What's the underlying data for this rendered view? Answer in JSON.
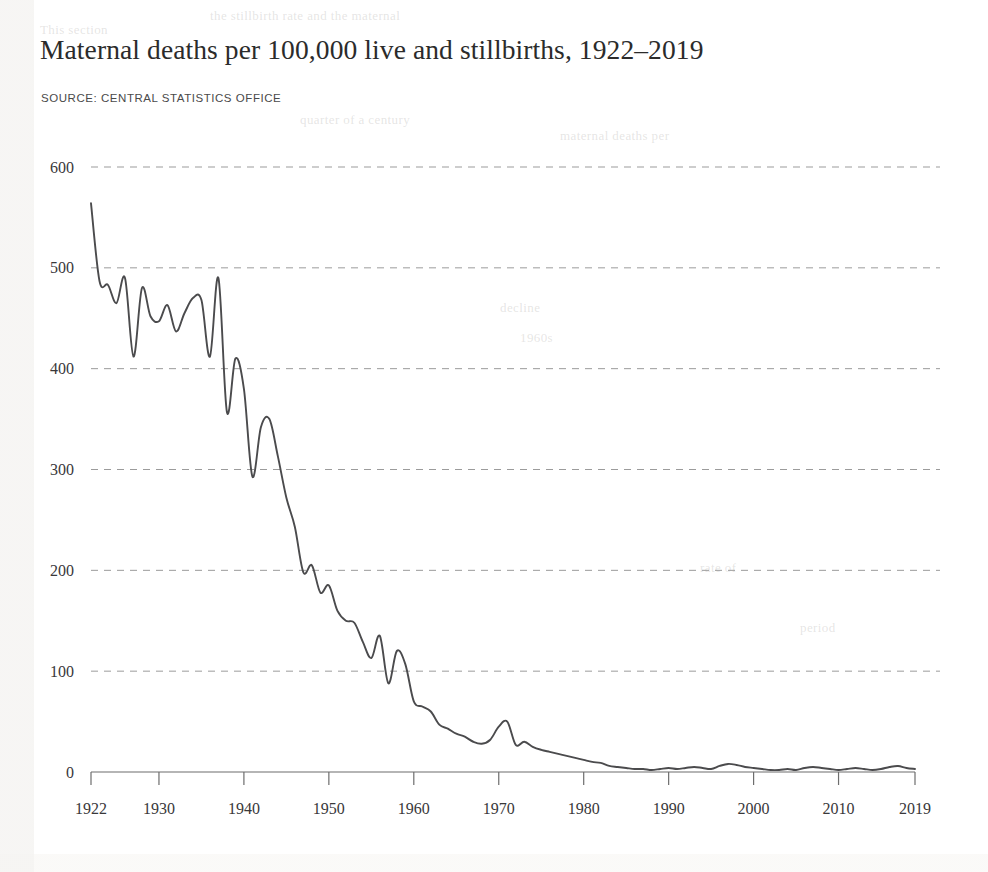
{
  "header": {
    "title": "Maternal deaths per 100,000 live and stillbirths, 1922–2019",
    "source": "SOURCE: CENTRAL STATISTICS OFFICE"
  },
  "ghost": [
    {
      "text": "the stillbirth rate and the maternal",
      "x": 210,
      "y": 8
    },
    {
      "text": "This section",
      "x": 40,
      "y": 22
    },
    {
      "text": "quarter of a century",
      "x": 300,
      "y": 112
    },
    {
      "text": "maternal deaths per",
      "x": 560,
      "y": 128
    },
    {
      "text": "decline",
      "x": 500,
      "y": 300
    },
    {
      "text": "1960s",
      "x": 520,
      "y": 330
    },
    {
      "text": "rate of",
      "x": 700,
      "y": 560
    },
    {
      "text": "period",
      "x": 800,
      "y": 620
    }
  ],
  "style": {
    "line_color": "#4b4b4d",
    "gridline_color": "#9b9b9b",
    "axis_color": "#6d6d6d",
    "text_color": "#39383a"
  },
  "chart_data": {
    "type": "line",
    "title": "Maternal deaths per 100,000 live and stillbirths, 1922–2019",
    "subtitle": "SOURCE: CENTRAL STATISTICS OFFICE",
    "xlabel": "",
    "ylabel": "",
    "xlim": [
      1922,
      2019
    ],
    "ylim": [
      0,
      600
    ],
    "grid": true,
    "grid_axis": "y",
    "legend": false,
    "y_ticks": [
      0,
      100,
      200,
      300,
      400,
      500,
      600
    ],
    "y_tick_labels": [
      "0",
      "100",
      "200",
      "300",
      "400",
      "500",
      "600"
    ],
    "x_ticks": [
      1922,
      1930,
      1940,
      1950,
      1960,
      1970,
      1980,
      1990,
      2000,
      2010,
      2019
    ],
    "x_tick_labels": [
      "1922",
      "1930",
      "1940",
      "1950",
      "1960",
      "1970",
      "1980",
      "1990",
      "2000",
      "2010",
      "2019"
    ],
    "series": [
      {
        "name": "Maternal deaths per 100,000 live and stillbirths",
        "x": [
          1922,
          1923,
          1924,
          1925,
          1926,
          1927,
          1928,
          1929,
          1930,
          1931,
          1932,
          1933,
          1934,
          1935,
          1936,
          1937,
          1938,
          1939,
          1940,
          1941,
          1942,
          1943,
          1944,
          1945,
          1946,
          1947,
          1948,
          1949,
          1950,
          1951,
          1952,
          1953,
          1954,
          1955,
          1956,
          1957,
          1958,
          1959,
          1960,
          1961,
          1962,
          1963,
          1964,
          1965,
          1966,
          1967,
          1968,
          1969,
          1970,
          1971,
          1972,
          1973,
          1974,
          1975,
          1976,
          1977,
          1978,
          1979,
          1980,
          1981,
          1982,
          1983,
          1984,
          1985,
          1986,
          1987,
          1988,
          1989,
          1990,
          1991,
          1992,
          1993,
          1994,
          1995,
          1996,
          1997,
          1998,
          1999,
          2000,
          2001,
          2002,
          2003,
          2004,
          2005,
          2006,
          2007,
          2008,
          2009,
          2010,
          2011,
          2012,
          2013,
          2014,
          2015,
          2016,
          2017,
          2018,
          2019
        ],
        "values": [
          564,
          487,
          483,
          465,
          490,
          412,
          480,
          452,
          447,
          463,
          437,
          455,
          470,
          468,
          412,
          490,
          357,
          410,
          380,
          293,
          342,
          350,
          313,
          272,
          243,
          198,
          205,
          178,
          185,
          160,
          150,
          148,
          129,
          113,
          135,
          88,
          120,
          107,
          70,
          65,
          60,
          47,
          43,
          38,
          35,
          30,
          28,
          32,
          45,
          50,
          27,
          30,
          25,
          22,
          20,
          18,
          16,
          14,
          12,
          10,
          9,
          6,
          5,
          4,
          3,
          3,
          2,
          3,
          4,
          3,
          4,
          5,
          4,
          3,
          6,
          8,
          7,
          5,
          4,
          3,
          2,
          2,
          3,
          2,
          4,
          5,
          4,
          3,
          2,
          3,
          4,
          3,
          2,
          3,
          5,
          6,
          4,
          3
        ]
      }
    ]
  }
}
